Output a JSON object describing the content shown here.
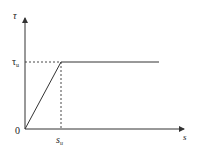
{
  "diagram": {
    "type": "bilinear shear-slip (bond-slip) constitutive curve",
    "y_axis": {
      "label": "τ"
    },
    "x_axis": {
      "label": "s"
    },
    "origin_label": "0",
    "y_marker": {
      "label": "τ",
      "subscript": "u"
    },
    "x_marker": {
      "label": "s",
      "subscript": "u"
    },
    "colors": {
      "line": "#333333",
      "background": "#ffffff"
    },
    "points": [
      {
        "x": 0,
        "y": 0
      },
      {
        "x": "s_u",
        "y": "τ_u"
      },
      {
        "x": "plateau_end",
        "y": "τ_u"
      }
    ]
  }
}
